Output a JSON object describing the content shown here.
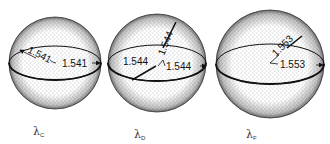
{
  "figure": {
    "spheres": [
      {
        "id": "c",
        "wavelength_label": "λ",
        "wavelength_sub": "C",
        "radius_labels": [
          "1.541",
          "1.541"
        ],
        "cx": 55,
        "cy": 63,
        "r": 46
      },
      {
        "id": "d",
        "wavelength_label": "λ",
        "wavelength_sub": "D",
        "radius_labels": [
          "1.544",
          "1.544",
          "1.544"
        ],
        "cx": 157,
        "cy": 63,
        "r": 49
      },
      {
        "id": "f",
        "wavelength_label": "λ",
        "wavelength_sub": "F",
        "radius_labels": [
          "1.553",
          "1.553"
        ],
        "cx": 270,
        "cy": 64,
        "r": 54
      }
    ],
    "colors": {
      "ink": "#111111",
      "stipple": "#555555",
      "background": "#ffffff"
    }
  }
}
